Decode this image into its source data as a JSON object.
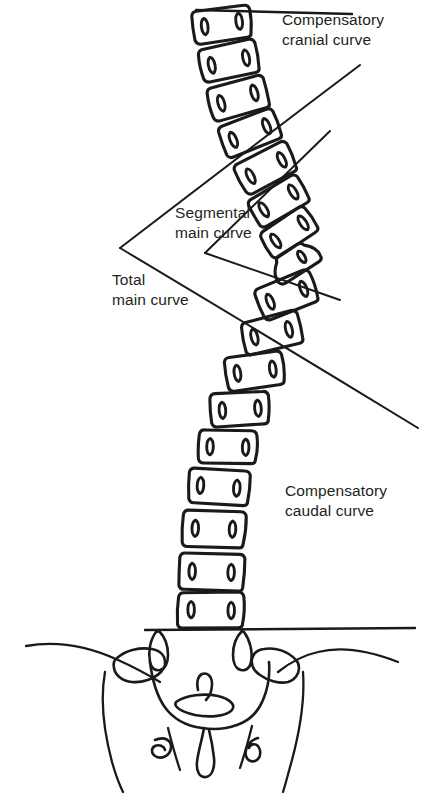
{
  "figure": {
    "type": "anatomical-line-drawing",
    "background_color": "#ffffff",
    "ink_color": "#1a1a1a",
    "text_color": "#231f20"
  },
  "labels": {
    "compensatory_cranial": "Compensatory\ncranial curve",
    "segmental_main": "Segmental\nmain curve",
    "total_main": "Total\nmain curve",
    "compensatory_caudal": "Compensatory\ncaudal curve"
  },
  "annotation_lines": [
    {
      "name": "horizontal-reference-top",
      "description": "horizontal line along superior endplate of uppermost vertebra",
      "x1": 196,
      "y1": 10,
      "x2": 352,
      "y2": 14
    },
    {
      "name": "total-main-curve-upper-limb",
      "description": "tangent from upper end vertebra to total-curve vertex",
      "x1": 360,
      "y1": 65,
      "x2": 120,
      "y2": 248
    },
    {
      "name": "total-main-curve-lower-limb",
      "description": "tangent from total-curve vertex to lower end vertebra",
      "x1": 120,
      "y1": 248,
      "x2": 418,
      "y2": 428
    },
    {
      "name": "segmental-main-curve-upper-limb",
      "description": "tangent from apex-region upper vertebra to segmental vertex",
      "x1": 330,
      "y1": 131,
      "x2": 205,
      "y2": 253
    },
    {
      "name": "segmental-main-curve-lower-limb",
      "description": "tangent from segmental vertex to apex-region lower vertebra",
      "x1": 205,
      "y1": 253,
      "x2": 340,
      "y2": 300
    },
    {
      "name": "baseline-horizontal-sacral",
      "description": "horizontal reference line at sacral base",
      "x1": 145,
      "y1": 630,
      "x2": 415,
      "y2": 628
    }
  ],
  "vertebrae": [
    {
      "id": "v1",
      "cx": 222,
      "cy": 24,
      "w": 56,
      "h": 33,
      "rot": -7,
      "region": "cranial"
    },
    {
      "id": "v2",
      "cx": 229,
      "cy": 61,
      "w": 56,
      "h": 33,
      "rot": -12,
      "region": "cranial"
    },
    {
      "id": "v3",
      "cx": 238,
      "cy": 98,
      "w": 56,
      "h": 33,
      "rot": -16,
      "region": "cranial"
    },
    {
      "id": "v4",
      "cx": 250,
      "cy": 133,
      "w": 56,
      "h": 33,
      "rot": -22,
      "region": "transition"
    },
    {
      "id": "v5",
      "cx": 266,
      "cy": 168,
      "w": 56,
      "h": 33,
      "rot": -27,
      "region": "main"
    },
    {
      "id": "v6",
      "cx": 279,
      "cy": 201,
      "w": 54,
      "h": 32,
      "rot": -31,
      "region": "main"
    },
    {
      "id": "v7",
      "cx": 289,
      "cy": 232,
      "w": 52,
      "h": 30,
      "rot": -34,
      "region": "main"
    },
    {
      "id": "v8",
      "cx": 295,
      "cy": 261,
      "w": 48,
      "h": 26,
      "rot": -32,
      "region": "apex-wedge"
    },
    {
      "id": "v9",
      "cx": 287,
      "cy": 295,
      "w": 56,
      "h": 33,
      "rot": -22,
      "region": "main"
    },
    {
      "id": "v10",
      "cx": 272,
      "cy": 333,
      "w": 56,
      "h": 33,
      "rot": -14,
      "region": "main"
    },
    {
      "id": "v11",
      "cx": 255,
      "cy": 371,
      "w": 56,
      "h": 33,
      "rot": -8,
      "region": "caudal"
    },
    {
      "id": "v12",
      "cx": 240,
      "cy": 409,
      "w": 56,
      "h": 33,
      "rot": -4,
      "region": "caudal"
    },
    {
      "id": "v13",
      "cx": 228,
      "cy": 447,
      "w": 56,
      "h": 33,
      "rot": 1,
      "region": "caudal"
    },
    {
      "id": "v14",
      "cx": 219,
      "cy": 487,
      "w": 58,
      "h": 35,
      "rot": 3,
      "region": "caudal"
    },
    {
      "id": "v15",
      "cx": 214,
      "cy": 529,
      "w": 60,
      "h": 36,
      "rot": 2,
      "region": "caudal"
    },
    {
      "id": "v16",
      "cx": 212,
      "cy": 572,
      "w": 62,
      "h": 37,
      "rot": 1,
      "region": "caudal"
    },
    {
      "id": "v17",
      "cx": 211,
      "cy": 610,
      "w": 64,
      "h": 36,
      "rot": 0,
      "region": "caudal"
    }
  ],
  "pelvis": {
    "name": "sacrum-and-ilia",
    "sacral_foramina_count": 3,
    "ala_count": 2
  }
}
